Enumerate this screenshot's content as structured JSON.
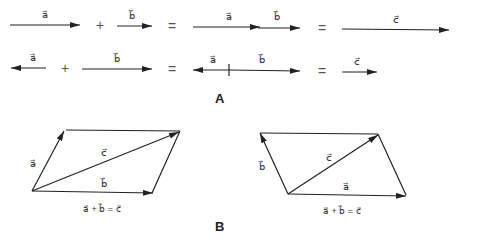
{
  "diagram": {
    "type": "vector-addition",
    "colors": {
      "stroke": "#222222",
      "text": "#333333",
      "background": "#ffffff"
    },
    "section_a": {
      "label": "A",
      "row1": {
        "terms": [
          {
            "label": "a",
            "direction": "right"
          },
          {
            "operator": "+"
          },
          {
            "label": "b",
            "direction": "right"
          },
          {
            "operator": "="
          },
          {
            "labels": [
              "a",
              "b"
            ],
            "description": "a followed by b, head to tail"
          },
          {
            "operator": "="
          },
          {
            "label": "c",
            "direction": "right"
          }
        ]
      },
      "row2": {
        "terms": [
          {
            "label": "a",
            "direction": "left"
          },
          {
            "operator": "+"
          },
          {
            "label": "b",
            "direction": "right"
          },
          {
            "operator": "="
          },
          {
            "labels": [
              "a",
              "b"
            ],
            "description": "a pointing left, b pointing right, from common point"
          },
          {
            "operator": "="
          },
          {
            "label": "c",
            "direction": "right"
          }
        ]
      }
    },
    "section_b": {
      "label": "B",
      "left_parallelogram": {
        "side_label": "a",
        "diagonal_label": "c",
        "base_label": "b",
        "equation": "a + b = c"
      },
      "right_parallelogram": {
        "side_label": "b",
        "diagonal_label": "c",
        "base_label": "a",
        "equation": "a + b = c"
      }
    }
  },
  "text": {
    "plus": "+",
    "equals": "=",
    "vec_a": "a⃗",
    "vec_b": "b⃗",
    "vec_c": "c⃗",
    "eq_b": "a⃗ + b⃗ = c⃗",
    "label_A": "A",
    "label_B": "B"
  }
}
